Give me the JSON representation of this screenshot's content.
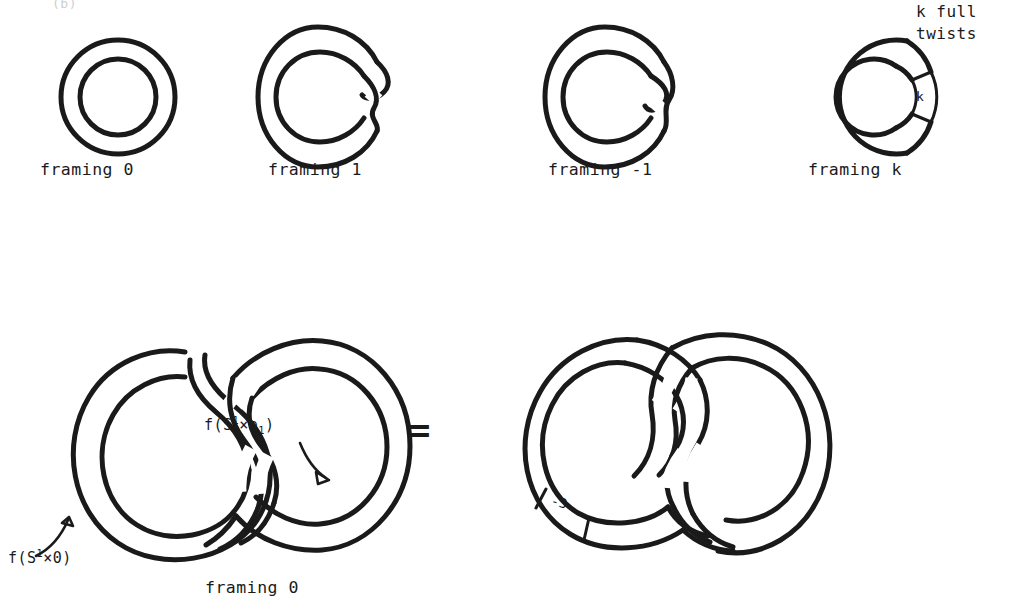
{
  "figure": {
    "kind": "knot-framing-diagram",
    "ink_color": "#1a1a1a",
    "background": "#ffffff",
    "partial_top_text": "(b)"
  },
  "top_row": {
    "items": [
      {
        "caption": "framing 0",
        "twist_count": 0,
        "box_label": null,
        "name": "framing-0"
      },
      {
        "caption": "framing 1",
        "twist_count": 1,
        "box_label": null,
        "name": "framing-1"
      },
      {
        "caption": "framing -1",
        "twist_count": -1,
        "box_label": null,
        "name": "framing-minus-1"
      },
      {
        "caption": "framing k",
        "twist_count": "k",
        "box_label": "k",
        "name": "framing-k"
      }
    ],
    "annotation": {
      "line1": "k full",
      "line2": "twists"
    }
  },
  "bottom_row": {
    "left": {
      "caption": "framing 0",
      "label_core": "f(S¹×0)",
      "label_core_parts": {
        "pre": "f(S",
        "sup": "1",
        "mid": "×0)"
      },
      "label_section": "f(S¹×e₁)",
      "label_section_parts": {
        "pre": "f(S",
        "sup": "1",
        "mid": "×e",
        "sub": "1",
        "post": ")"
      },
      "name": "hopf-link-framing-0"
    },
    "relation": "=",
    "right": {
      "box_label": "-3",
      "name": "hopf-link-minus-3"
    }
  }
}
